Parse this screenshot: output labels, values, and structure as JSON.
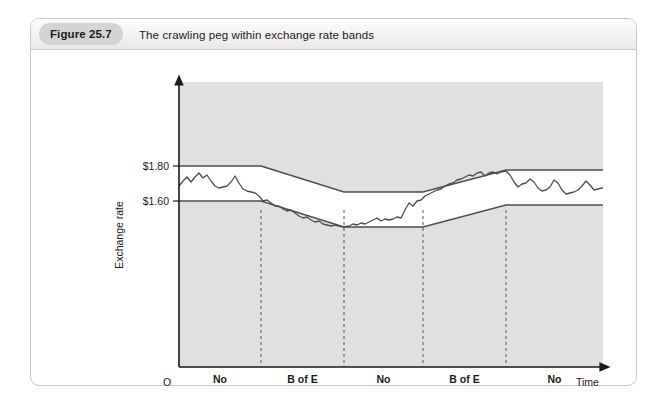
{
  "figure": {
    "badge": "Figure 25.7",
    "caption": "The crawling peg within exchange rate bands"
  },
  "chart_data": {
    "type": "line",
    "title": "The crawling peg within exchange rate bands",
    "xlabel": "Time",
    "ylabel": "Exchange rate",
    "origin_label": "O",
    "ytick_labels": [
      "$1.80",
      "$1.60"
    ],
    "ytick_values": [
      1.8,
      1.6
    ],
    "grid": false,
    "legend": "none",
    "segments": [
      {
        "label_line1": "No",
        "label_line2": "intervention"
      },
      {
        "label_line1": "B of E",
        "label_line2": "buys pounds"
      },
      {
        "label_line1": "No",
        "label_line2": "intervention"
      },
      {
        "label_line1": "B of E",
        "label_line2": "sells pounds"
      },
      {
        "label_line1": "No",
        "label_line2": "intervention"
      }
    ],
    "band_upper": "M 148,146 L 230,146 L 313,172 L 392,172 L 475,150 L 572,150",
    "band_lower": "M 148,181 L 230,181 L 313,207 L 392,207 L 475,185 L 572,185",
    "rate_line": "M 148,166 L 152,161 L 156,157 L 160,162 L 164,157 L 168,153 L 172,158 L 176,155 L 180,161 L 184,166 L 188,168 L 192,167 L 196,166 L 200,162 L 204,156 L 208,163 L 212,169 L 216,171 L 220,172 L 224,173 L 228,176 L 232,181 L 236,180 L 240,183 L 244,186 L 248,186 L 252,189 L 256,191 L 260,190 L 264,193 L 268,196 L 272,198 L 276,197 L 280,200 L 284,202 L 288,201 L 292,204 L 296,205 L 300,206 L 304,205 L 308,206 L 313,207 L 318,206 L 322,204 L 326,205 L 330,203 L 334,204 L 338,202 L 342,200 L 346,198 L 350,201 L 354,199 L 358,200 L 362,199 L 366,197 L 370,198 L 374,190 L 378,183 L 382,186 L 386,181 L 390,180 L 394,176 L 398,174 L 402,172 L 406,170 L 410,169 L 414,166 L 418,164 L 422,163 L 426,160 L 430,159 L 434,157 L 438,155 L 442,156 L 446,153 L 450,152 L 454,156 L 458,153 L 462,152 L 466,154 L 470,152 L 475,151 L 479,155 L 483,162 L 487,167 L 491,164 L 495,163 L 499,159 L 503,162 L 507,168 L 511,171 L 515,170 L 519,167 L 523,160 L 527,163 L 531,170 L 535,174 L 539,173 L 543,172 L 547,170 L 551,166 L 555,161 L 559,165 L 563,170 L 567,169 L 571,168 L 572,168",
    "dividers": [
      230,
      313,
      392,
      475
    ],
    "colors": {
      "plot_area": "#e0e0e0",
      "band_fill": "#ffffff",
      "line": "#4d4d4d",
      "axis": "#1a1a1a",
      "badge": "#d4d4d4",
      "card_border": "#c8c8c8"
    }
  }
}
